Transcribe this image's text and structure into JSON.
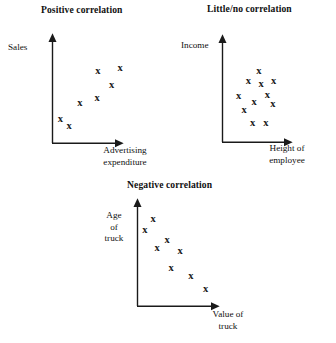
{
  "figure": {
    "background_color": "#ffffff",
    "marker_color": "#1a1a1a",
    "axis_color": "#1a1a1a",
    "marker_glyph": "x"
  },
  "chart_data": [
    {
      "type": "scatter",
      "title": "Positive correlation",
      "xlabel": "Advertising\nexpenditure",
      "xlabel_lines": [
        "Advertising",
        "expenditure"
      ],
      "ylabel": "Sales",
      "ylabel_lines": [
        "Sales"
      ],
      "grid": false,
      "legend": "none",
      "axis_ticks": false,
      "xlim": [
        0,
        10
      ],
      "ylim": [
        0,
        10
      ],
      "points": [
        {
          "x": 1.1,
          "y": 2.4
        },
        {
          "x": 2.3,
          "y": 1.7
        },
        {
          "x": 3.8,
          "y": 3.9
        },
        {
          "x": 6.2,
          "y": 4.4
        },
        {
          "x": 8.2,
          "y": 5.6
        },
        {
          "x": 6.3,
          "y": 7.0
        },
        {
          "x": 9.4,
          "y": 7.3
        }
      ]
    },
    {
      "type": "scatter",
      "title": "Little/no correlation",
      "xlabel": "Height of\nemployee",
      "xlabel_lines": [
        "Height of",
        "employee"
      ],
      "ylabel": "Income",
      "ylabel_lines": [
        "Income"
      ],
      "grid": false,
      "legend": "none",
      "axis_ticks": false,
      "xlim": [
        0,
        10
      ],
      "ylim": [
        0,
        10
      ],
      "points": [
        {
          "x": 5.2,
          "y": 7.0
        },
        {
          "x": 3.7,
          "y": 6.0
        },
        {
          "x": 5.5,
          "y": 5.7
        },
        {
          "x": 7.3,
          "y": 6.0
        },
        {
          "x": 2.3,
          "y": 4.6
        },
        {
          "x": 4.5,
          "y": 4.0
        },
        {
          "x": 7.2,
          "y": 3.8
        },
        {
          "x": 3.1,
          "y": 3.2
        },
        {
          "x": 4.3,
          "y": 1.9
        },
        {
          "x": 6.2,
          "y": 1.9
        },
        {
          "x": 6.4,
          "y": 4.7
        }
      ]
    },
    {
      "type": "scatter",
      "title": "Negative correlation",
      "xlabel": "Value of\ntruck",
      "xlabel_lines": [
        "Value of",
        "truck"
      ],
      "ylabel": "Age\nof\ntruck",
      "ylabel_lines": [
        "Age",
        "of",
        "truck"
      ],
      "grid": false,
      "legend": "none",
      "axis_ticks": false,
      "xlim": [
        0,
        10
      ],
      "ylim": [
        0,
        10
      ],
      "points": [
        {
          "x": 1.9,
          "y": 8.6
        },
        {
          "x": 0.9,
          "y": 7.5
        },
        {
          "x": 3.6,
          "y": 6.5
        },
        {
          "x": 2.4,
          "y": 5.7
        },
        {
          "x": 5.2,
          "y": 5.4
        },
        {
          "x": 4.1,
          "y": 3.8
        },
        {
          "x": 6.5,
          "y": 3.0
        },
        {
          "x": 8.3,
          "y": 1.7
        }
      ]
    }
  ]
}
